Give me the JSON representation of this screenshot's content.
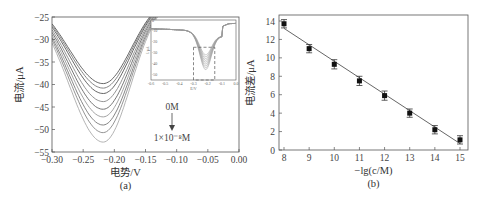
{
  "chart_data": [
    {
      "type": "line",
      "panel": "(a)",
      "xlabel": "电势/V",
      "ylabel": "电流/μA",
      "xlim": [
        -0.3,
        0.0
      ],
      "ylim": [
        -55,
        -25
      ],
      "xticks": [
        "-0.30",
        "-0.25",
        "-0.20",
        "-0.15",
        "-0.10",
        "-0.05",
        "0.00"
      ],
      "yticks": [
        "-25",
        "-30",
        "-35",
        "-40",
        "-45",
        "-50",
        "-55"
      ],
      "annotation_top": "0M",
      "annotation_bottom": "1×10⁻⁸M",
      "series": [
        {
          "name": "curve1",
          "peak_x": -0.218,
          "peak_y": -39.8
        },
        {
          "name": "curve2",
          "peak_x": -0.218,
          "peak_y": -40.8
        },
        {
          "name": "curve3",
          "peak_x": -0.218,
          "peak_y": -42.0
        },
        {
          "name": "curve4",
          "peak_x": -0.218,
          "peak_y": -43.8
        },
        {
          "name": "curve5",
          "peak_x": -0.218,
          "peak_y": -45.5
        },
        {
          "name": "curve6",
          "peak_x": -0.218,
          "peak_y": -47.2
        },
        {
          "name": "curve7",
          "peak_x": -0.218,
          "peak_y": -49.0
        },
        {
          "name": "curve8",
          "peak_x": -0.218,
          "peak_y": -50.7
        },
        {
          "name": "curve9",
          "peak_x": -0.218,
          "peak_y": -52.8
        }
      ],
      "inset": {
        "xlabel": "E/V",
        "ylabel": "I/μA",
        "xticks": [
          "-0.6",
          "-0.5",
          "-0.4",
          "-0.3",
          "-0.2",
          "-0.1",
          "0.0"
        ],
        "yticks": [
          "0",
          "-10",
          "-20",
          "-30",
          "-40",
          "-50"
        ],
        "xlim": [
          -0.6,
          0.0
        ],
        "ylim": [
          -55,
          0
        ],
        "highlight_box": {
          "x": [
            -0.3,
            -0.15
          ],
          "y": [
            -55,
            -25
          ]
        }
      }
    },
    {
      "type": "scatter",
      "panel": "(b)",
      "xlabel": "−lg(c/M)",
      "ylabel": "电流差/μA",
      "xlim": [
        8,
        15
      ],
      "ylim": [
        0,
        14
      ],
      "xticks": [
        "8",
        "9",
        "10",
        "11",
        "12",
        "13",
        "14",
        "15"
      ],
      "yticks": [
        "0",
        "2",
        "4",
        "6",
        "8",
        "10",
        "12",
        "14"
      ],
      "x": [
        8,
        9,
        10,
        11,
        12,
        13,
        14,
        15
      ],
      "values": [
        13.7,
        11.0,
        9.3,
        7.5,
        5.9,
        4.0,
        2.2,
        1.1
      ],
      "error": [
        0.45,
        0.45,
        0.5,
        0.5,
        0.5,
        0.45,
        0.45,
        0.45
      ],
      "fit_line": {
        "x": [
          8,
          15
        ],
        "y": [
          13.2,
          0.7
        ]
      }
    }
  ]
}
